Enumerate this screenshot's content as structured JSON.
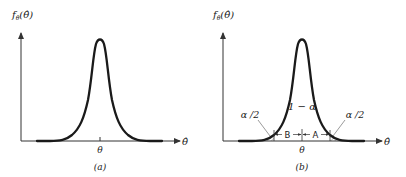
{
  "panels": [
    {
      "id": "a",
      "caption": "(a)",
      "y_axis_label": "fθ̂(θ̂)",
      "y_axis_main": "f",
      "y_axis_sub": "θ̂",
      "y_axis_arg": "(θ̂)",
      "x_axis_label": "θ̂",
      "center_tick_label": "θ"
    },
    {
      "id": "b",
      "caption": "(b)",
      "y_axis_label": "fθ̂(θ̂)",
      "y_axis_main": "f",
      "y_axis_sub": "θ̂",
      "y_axis_arg": "(θ̂)",
      "x_axis_label": "θ̂",
      "center_tick_label": "θ",
      "center_area_label": "1 − α",
      "left_tail_label": "α /2",
      "right_tail_label": "α /2",
      "left_interval_label": "B",
      "right_interval_label": "A"
    }
  ],
  "colors": {
    "ink": "#1a1a1a",
    "axis": "#333333",
    "hatch": "#555555",
    "background": "#ffffff"
  }
}
